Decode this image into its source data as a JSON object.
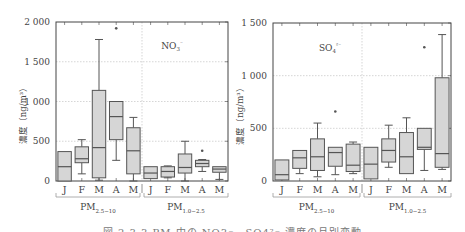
{
  "figure": {
    "caption": "図 2.3.3 PM 中の NO3⁻、SO4²⁻ 濃度の月別変動"
  },
  "chart_data": [
    {
      "type": "box",
      "title": "NO3-",
      "ion_label": "NO3⁻",
      "ylabel": "濃度（ng/m³）",
      "ylim": [
        0,
        2000
      ],
      "yticks": [
        0,
        500,
        1000,
        1500,
        2000
      ],
      "ytick_labels": [
        "0",
        "500",
        "1 000",
        "1 500",
        "2 000"
      ],
      "grid": true,
      "groups": [
        {
          "name": "PM2.5-10",
          "label_main": "PM",
          "label_sub": "2.5−10",
          "categories": [
            "J",
            "F",
            "M",
            "A",
            "M"
          ],
          "boxes": [
            {
              "month": "J",
              "whislo": 0,
              "q1": 0,
              "med": 180,
              "q3": 370,
              "whishi": 370,
              "fliers": []
            },
            {
              "month": "F",
              "whislo": 90,
              "q1": 230,
              "med": 280,
              "q3": 430,
              "whishi": 520,
              "fliers": []
            },
            {
              "month": "M",
              "whislo": 10,
              "q1": 40,
              "med": 420,
              "q3": 1140,
              "whishi": 1780,
              "fliers": []
            },
            {
              "month": "A",
              "whislo": 260,
              "q1": 520,
              "med": 810,
              "q3": 1000,
              "whishi": 1000,
              "fliers": [
                1920
              ]
            },
            {
              "month": "M",
              "whislo": 0,
              "q1": 90,
              "med": 380,
              "q3": 670,
              "whishi": 800,
              "fliers": []
            }
          ]
        },
        {
          "name": "PM1.0-2.5",
          "label_main": "PM",
          "label_sub": "1.0−2.5",
          "categories": [
            "J",
            "F",
            "M",
            "A",
            "M"
          ],
          "boxes": [
            {
              "month": "J",
              "whislo": 30,
              "q1": 30,
              "med": 100,
              "q3": 180,
              "whishi": 180,
              "fliers": []
            },
            {
              "month": "F",
              "whislo": 40,
              "q1": 50,
              "med": 120,
              "q3": 180,
              "whishi": 190,
              "fliers": []
            },
            {
              "month": "M",
              "whislo": 0,
              "q1": 100,
              "med": 170,
              "q3": 340,
              "whishi": 500,
              "fliers": []
            },
            {
              "month": "A",
              "whislo": 120,
              "q1": 180,
              "med": 220,
              "q3": 260,
              "whishi": 270,
              "fliers": [
                380
              ]
            },
            {
              "month": "M",
              "whislo": 20,
              "q1": 110,
              "med": 150,
              "q3": 180,
              "whishi": 180,
              "fliers": []
            }
          ]
        }
      ]
    },
    {
      "type": "box",
      "title": "SO4 2-",
      "ion_label": "SO4²⁻",
      "ylabel": "濃度（ng/m³）",
      "ylim": [
        0,
        1500
      ],
      "yticks": [
        0,
        500,
        1000,
        1500
      ],
      "ytick_labels": [
        "0",
        "500",
        "1 000",
        "1 500"
      ],
      "grid": true,
      "groups": [
        {
          "name": "PM2.5-10",
          "label_main": "PM",
          "label_sub": "2.5−10",
          "categories": [
            "J",
            "F",
            "M",
            "A",
            "M"
          ],
          "boxes": [
            {
              "month": "J",
              "whislo": 10,
              "q1": 10,
              "med": 60,
              "q3": 200,
              "whishi": 200,
              "fliers": []
            },
            {
              "month": "F",
              "whislo": 70,
              "q1": 120,
              "med": 220,
              "q3": 290,
              "whishi": 290,
              "fliers": []
            },
            {
              "month": "M",
              "whislo": 40,
              "q1": 100,
              "med": 230,
              "q3": 400,
              "whishi": 550,
              "fliers": []
            },
            {
              "month": "A",
              "whislo": 60,
              "q1": 140,
              "med": 270,
              "q3": 320,
              "whishi": 320,
              "fliers": [
                660
              ]
            },
            {
              "month": "M",
              "whislo": 70,
              "q1": 90,
              "med": 150,
              "q3": 350,
              "whishi": 370,
              "fliers": []
            }
          ]
        },
        {
          "name": "PM1.0-2.5",
          "label_main": "PM",
          "label_sub": "1.0−2.5",
          "categories": [
            "J",
            "F",
            "M",
            "A",
            "M"
          ],
          "boxes": [
            {
              "month": "J",
              "whislo": 20,
              "q1": 20,
              "med": 160,
              "q3": 320,
              "whishi": 320,
              "fliers": []
            },
            {
              "month": "F",
              "whislo": 130,
              "q1": 180,
              "med": 290,
              "q3": 400,
              "whishi": 530,
              "fliers": []
            },
            {
              "month": "M",
              "whislo": 70,
              "q1": 70,
              "med": 230,
              "q3": 460,
              "whishi": 600,
              "fliers": []
            },
            {
              "month": "A",
              "whislo": 100,
              "q1": 300,
              "med": 320,
              "q3": 500,
              "whishi": 500,
              "fliers": [
                1270
              ]
            },
            {
              "month": "M",
              "whislo": 110,
              "q1": 130,
              "med": 260,
              "q3": 980,
              "whishi": 1390,
              "fliers": []
            }
          ]
        }
      ]
    }
  ],
  "colors": {
    "box_fill": "#d6d6d6",
    "box_stroke": "#555555",
    "axis": "#444444",
    "grid": "#bbbbbb"
  }
}
